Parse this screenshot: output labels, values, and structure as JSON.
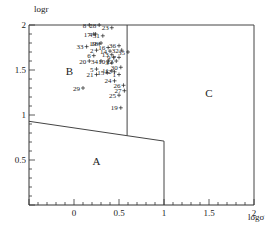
{
  "chart_data": {
    "type": "scatter",
    "title": "",
    "xlabel": "logσ",
    "ylabel": "logr",
    "xlim": [
      -0.5,
      2
    ],
    "ylim": [
      0,
      2
    ],
    "x_ticks": [
      0,
      0.5,
      1,
      1.5,
      2
    ],
    "x_tick_labels": [
      "0",
      "0.5",
      "1",
      "1.5",
      "2"
    ],
    "y_ticks": [
      0.5,
      1,
      1.5,
      2
    ],
    "y_tick_labels": [
      "0.5",
      "1",
      "1.5",
      "2"
    ],
    "grid": false,
    "regions": [
      {
        "label": "A",
        "x": 0.25,
        "y": 0.45
      },
      {
        "label": "B",
        "x": -0.05,
        "y": 1.45
      },
      {
        "label": "C",
        "x": 1.5,
        "y": 1.2
      }
    ],
    "boundaries": [
      {
        "name": "A-B boundary",
        "points": [
          [
            -0.5,
            0.93
          ],
          [
            1.0,
            0.71
          ]
        ]
      },
      {
        "name": "B-C boundary",
        "points": [
          [
            0.59,
            2.0
          ],
          [
            0.59,
            0.77
          ]
        ]
      },
      {
        "name": "A-C boundary",
        "points": [
          [
            1.0,
            0.71
          ],
          [
            1.0,
            0.0
          ]
        ]
      },
      {
        "name": "right boundary",
        "points": [
          [
            2.0,
            2.0
          ],
          [
            2.0,
            0.0
          ]
        ]
      },
      {
        "name": "top boundary",
        "points": [
          [
            -0.5,
            2.0
          ],
          [
            2.0,
            2.0
          ]
        ]
      }
    ],
    "points": [
      {
        "label": "8",
        "x": 0.17,
        "y": 2.0
      },
      {
        "label": "28",
        "x": 0.28,
        "y": 2.0
      },
      {
        "label": "23",
        "x": 0.42,
        "y": 1.97
      },
      {
        "label": "17",
        "x": 0.22,
        "y": 1.9
      },
      {
        "label": "4",
        "x": 0.24,
        "y": 1.9
      },
      {
        "label": "31",
        "x": 0.32,
        "y": 1.88
      },
      {
        "label": "19",
        "x": 0.28,
        "y": 1.79
      },
      {
        "label": "18",
        "x": 0.3,
        "y": 1.8
      },
      {
        "label": "33",
        "x": 0.14,
        "y": 1.76
      },
      {
        "label": "16",
        "x": 0.38,
        "y": 1.75
      },
      {
        "label": "36",
        "x": 0.5,
        "y": 1.77
      },
      {
        "label": "2",
        "x": 0.25,
        "y": 1.72
      },
      {
        "label": "14",
        "x": 0.4,
        "y": 1.71
      },
      {
        "label": "32",
        "x": 0.53,
        "y": 1.72
      },
      {
        "label": "35",
        "x": 0.6,
        "y": 1.7
      },
      {
        "label": "6",
        "x": 0.22,
        "y": 1.66
      },
      {
        "label": "13",
        "x": 0.42,
        "y": 1.67
      },
      {
        "label": "9",
        "x": 0.44,
        "y": 1.64
      },
      {
        "label": "7",
        "x": 0.5,
        "y": 1.64
      },
      {
        "label": "20",
        "x": 0.17,
        "y": 1.6
      },
      {
        "label": "34",
        "x": 0.3,
        "y": 1.6
      },
      {
        "label": "22",
        "x": 0.47,
        "y": 1.6
      },
      {
        "label": "10",
        "x": 0.38,
        "y": 1.6
      },
      {
        "label": "3",
        "x": 0.42,
        "y": 1.58
      },
      {
        "label": "30",
        "x": 0.52,
        "y": 1.53
      },
      {
        "label": "5",
        "x": 0.25,
        "y": 1.51
      },
      {
        "label": "11",
        "x": 0.42,
        "y": 1.49
      },
      {
        "label": "12",
        "x": 0.45,
        "y": 1.48
      },
      {
        "label": "21",
        "x": 0.25,
        "y": 1.45
      },
      {
        "label": "15",
        "x": 0.37,
        "y": 1.47
      },
      {
        "label": "1",
        "x": 0.5,
        "y": 1.45
      },
      {
        "label": "24",
        "x": 0.45,
        "y": 1.38
      },
      {
        "label": "26",
        "x": 0.55,
        "y": 1.33
      },
      {
        "label": "29",
        "x": 0.1,
        "y": 1.3
      },
      {
        "label": "27",
        "x": 0.56,
        "y": 1.27
      },
      {
        "label": "25",
        "x": 0.5,
        "y": 1.22
      },
      {
        "label": "19",
        "x": 0.52,
        "y": 1.08
      }
    ]
  }
}
